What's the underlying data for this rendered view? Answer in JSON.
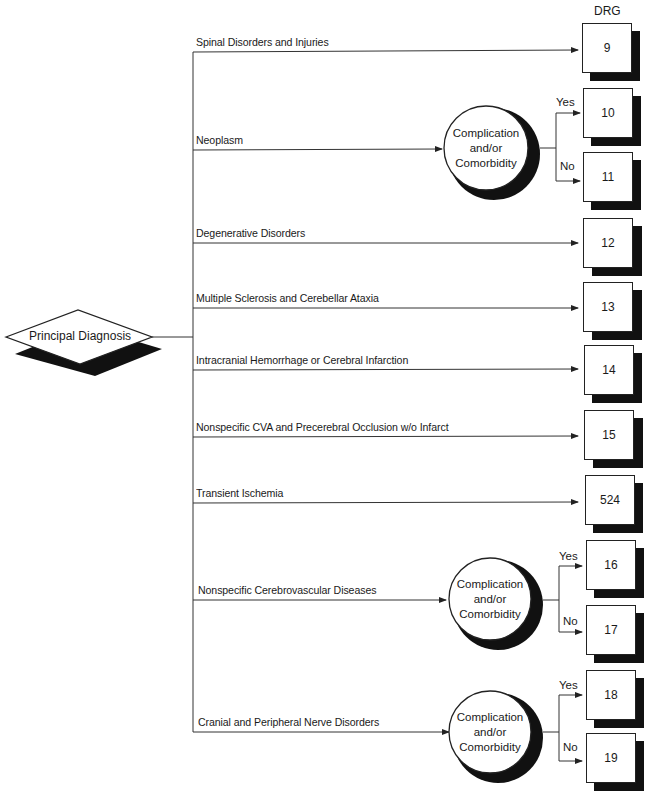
{
  "diagram": {
    "root": {
      "label": "Principal Diagnosis"
    },
    "column_header": "DRG",
    "decision_node_label": [
      "Complication",
      "and/or",
      "Comorbidity"
    ],
    "yes_label": "Yes",
    "no_label": "No",
    "branches": [
      {
        "label": "Spinal Disorders and Injuries",
        "drg": "9"
      },
      {
        "label": "Neoplasm",
        "decision": true,
        "yes_drg": "10",
        "no_drg": "11"
      },
      {
        "label": "Degenerative Disorders",
        "drg": "12"
      },
      {
        "label": "Multiple Sclerosis and Cerebellar Ataxia",
        "drg": "13"
      },
      {
        "label": "Intracranial Hemorrhage or Cerebral Infarction",
        "drg": "14"
      },
      {
        "label": "Nonspecific CVA and Precerebral Occlusion w/o Infarct",
        "drg": "15"
      },
      {
        "label": "Transient Ischemia",
        "drg": "524"
      },
      {
        "label": "Nonspecific Cerebrovascular Diseases",
        "decision": true,
        "yes_drg": "16",
        "no_drg": "17"
      },
      {
        "label": "Cranial and Peripheral Nerve Disorders",
        "decision": true,
        "yes_drg": "18",
        "no_drg": "19"
      }
    ]
  }
}
